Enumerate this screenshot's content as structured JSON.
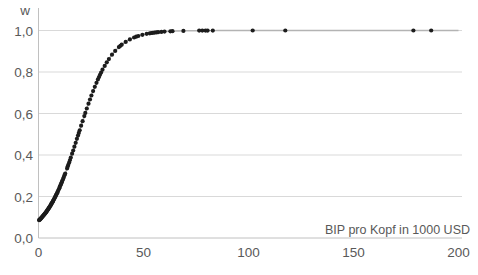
{
  "chart_data": {
    "type": "scatter",
    "title": "w",
    "xlabel": "BIP pro Kopf in 1000 USD",
    "ylabel": "w",
    "xlim": [
      0,
      202
    ],
    "ylim": [
      0,
      1.1
    ],
    "grid": "horizontal-only",
    "legend": "none",
    "x_ticks": {
      "values": [
        0,
        50,
        100,
        150,
        200
      ],
      "labels": [
        "0",
        "50",
        "100",
        "150",
        "200"
      ]
    },
    "y_ticks": {
      "values": [
        0,
        0.2,
        0.4,
        0.6,
        0.8,
        1.0
      ],
      "labels": [
        "0,0",
        "0,2",
        "0,4",
        "0,6",
        "0,8",
        "1,0"
      ]
    },
    "curve": {
      "model": "logistic",
      "formula": "w(x) = 1 / (1 + exp(-(x - 19) / 7.9))",
      "midpoint": 19,
      "steepness": 7.9,
      "w_at_x0": 0.08,
      "color": "#b3b3b3"
    },
    "points_x": [
      0.3,
      0.5,
      0.7,
      0.9,
      1.1,
      1.3,
      1.5,
      1.7,
      1.9,
      2.1,
      2.3,
      2.5,
      2.7,
      2.9,
      3.1,
      3.3,
      3.5,
      3.7,
      3.9,
      4.1,
      4.3,
      4.5,
      4.7,
      4.9,
      5.1,
      5.3,
      5.5,
      5.8,
      6.0,
      6.2,
      6.4,
      6.6,
      6.8,
      7.0,
      7.3,
      7.5,
      7.8,
      8.0,
      8.3,
      8.5,
      8.8,
      9.0,
      9.3,
      9.6,
      9.9,
      10.2,
      10.5,
      10.8,
      11.1,
      11.4,
      11.7,
      12.0,
      12.4,
      12.7,
      13.6,
      13.9,
      14.2,
      14.6,
      15.0,
      15.4,
      16.0,
      16.5,
      17.1,
      17.7,
      18.3,
      18.8,
      19.2,
      19.6,
      20.3,
      21.0,
      21.8,
      22.3,
      23.0,
      23.8,
      24.5,
      25.2,
      26.0,
      26.8,
      27.6,
      28.3,
      28.8,
      29.3,
      29.8,
      30.5,
      31.5,
      32.5,
      33.5,
      35.0,
      36.5,
      38.3,
      39.0,
      39.6,
      41.5,
      43.5,
      45.5,
      46.5,
      47.5,
      49.5,
      51.5,
      53.0,
      53.8,
      54.5,
      55.3,
      56.2,
      57.0,
      58.5,
      60.0,
      62.8,
      63.8,
      69.0,
      76.5,
      78.0,
      79.5,
      80.5,
      83.0,
      102.0,
      117.5,
      178.5,
      187.0
    ],
    "colors": {
      "point": "#1c1c1c",
      "curve": "#b3b3b3",
      "grid": "#d9d9d9",
      "axis": "#c0c0c0",
      "labels": "#595959",
      "background": "#ffffff"
    }
  }
}
